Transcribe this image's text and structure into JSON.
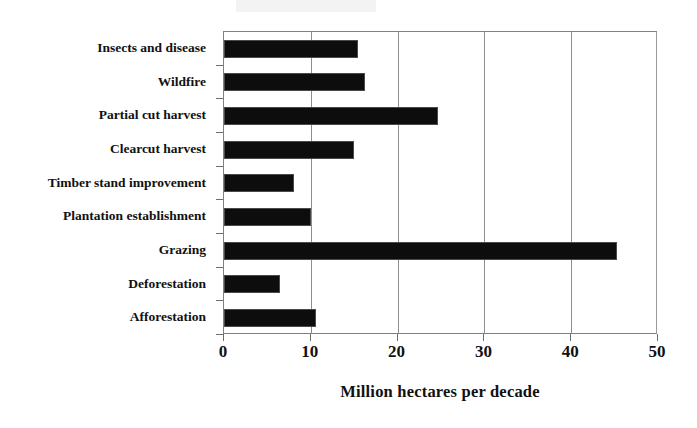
{
  "chart_data": {
    "type": "bar",
    "orientation": "horizontal",
    "title": "",
    "subtitle": "",
    "xlabel": "Million hectares per decade",
    "ylabel": "",
    "categories": [
      "Insects and disease",
      "Wildfire",
      "Partial cut harvest",
      "Clearcut harvest",
      "Timber stand improvement",
      "Plantation establishment",
      "Grazing",
      "Deforestation",
      "Afforestation"
    ],
    "values": [
      15.4,
      16.2,
      24.7,
      15.0,
      8.1,
      10.0,
      45.3,
      6.5,
      10.6
    ],
    "xlim": [
      0,
      50
    ],
    "xticks": [
      0,
      10,
      20,
      30,
      40,
      50
    ],
    "xtick_labels": [
      "0",
      "10",
      "20",
      "30",
      "40",
      "50"
    ],
    "grid": "vertical",
    "legend": "none",
    "bar_color": "#0d0d0d",
    "axis_color": "#808080",
    "gridline_color": "#8e8e8e",
    "background_color": "#ffffff"
  }
}
